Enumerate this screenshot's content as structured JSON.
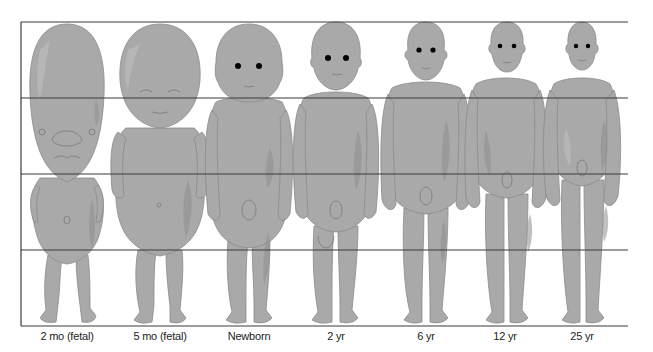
{
  "diagram": {
    "figures": [
      {
        "label": "2 mo (fetal)",
        "center_x": 67
      },
      {
        "label": "5 mo (fetal)",
        "center_x": 160
      },
      {
        "label": "Newborn",
        "center_x": 249
      },
      {
        "label": "2 yr",
        "center_x": 336
      },
      {
        "label": "6 yr",
        "center_x": 426
      },
      {
        "label": "12 yr",
        "center_x": 505
      },
      {
        "label": "25 yr",
        "center_x": 582
      }
    ],
    "grid": {
      "horizontal_lines_y": [
        22,
        98,
        174,
        250,
        326
      ],
      "divisions": 4,
      "left_x": 21,
      "right_x": 628
    },
    "colors": {
      "body_fill": "#a9a9a9",
      "line": "#3a3a3a",
      "background": "#ffffff"
    }
  }
}
